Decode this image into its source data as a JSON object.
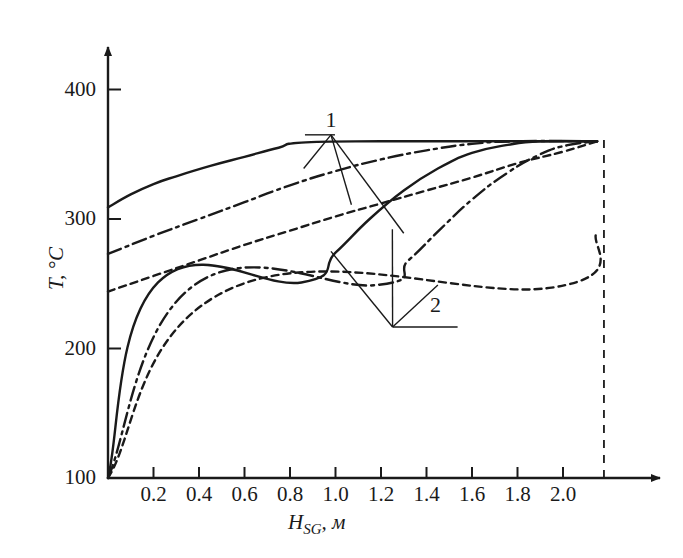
{
  "figure": {
    "background_color": "#ffffff",
    "ink_color": "#1a1a1a"
  },
  "axes": {
    "y": {
      "title": "T, °C",
      "ticks": [
        "100",
        "200",
        "300",
        "400"
      ],
      "tick_values": [
        100,
        200,
        300,
        400
      ],
      "range": [
        100,
        425
      ]
    },
    "x": {
      "title": "H_SG, м",
      "title_main": "H",
      "title_sub": "SG",
      "title_unit": ", м",
      "ticks": [
        "0.2",
        "0.4",
        "0.6",
        "0.8",
        "1.0",
        "1.2",
        "1.4",
        "1.6",
        "1.8",
        "2.0"
      ],
      "tick_values": [
        0.2,
        0.4,
        0.6,
        0.8,
        1.0,
        1.2,
        1.4,
        1.6,
        1.8,
        2.0
      ],
      "range": [
        0,
        2.27
      ]
    }
  },
  "annotations": [
    {
      "name": "group-label-1",
      "text": "1",
      "x": 0.98,
      "y": 365
    },
    {
      "name": "group-label-2",
      "text": "2",
      "x": 1.44,
      "y": 222
    }
  ],
  "chart_data": {
    "type": "line",
    "title": "",
    "xlabel": "H_SG, м",
    "ylabel": "T, °C",
    "xlim": [
      0,
      2.27
    ],
    "ylim": [
      100,
      425
    ],
    "grid": false,
    "legend": "none",
    "group_labels": [
      "1",
      "2"
    ],
    "series": [
      {
        "name": "group1-solid",
        "group": "1",
        "style": "solid",
        "points": [
          [
            0.0,
            309
          ],
          [
            0.1,
            319
          ],
          [
            0.2,
            327
          ],
          [
            0.3,
            333
          ],
          [
            0.45,
            341
          ],
          [
            0.6,
            348
          ],
          [
            0.75,
            355
          ],
          [
            0.85,
            359
          ],
          [
            1.2,
            360
          ],
          [
            1.6,
            360
          ],
          [
            2.15,
            360
          ]
        ]
      },
      {
        "name": "group1-dashdot",
        "group": "1",
        "style": "dashdot",
        "points": [
          [
            0.0,
            273
          ],
          [
            0.2,
            287
          ],
          [
            0.4,
            300
          ],
          [
            0.6,
            313
          ],
          [
            0.8,
            326
          ],
          [
            1.0,
            337
          ],
          [
            1.2,
            346
          ],
          [
            1.4,
            353
          ],
          [
            1.6,
            358
          ],
          [
            1.8,
            360
          ],
          [
            2.15,
            360
          ]
        ]
      },
      {
        "name": "group1-dashed",
        "group": "1",
        "style": "dashed",
        "points": [
          [
            0.0,
            244
          ],
          [
            0.2,
            256
          ],
          [
            0.4,
            268
          ],
          [
            0.6,
            280
          ],
          [
            0.8,
            291
          ],
          [
            1.0,
            302
          ],
          [
            1.2,
            312
          ],
          [
            1.4,
            322
          ],
          [
            1.6,
            332
          ],
          [
            1.8,
            343
          ],
          [
            2.0,
            352
          ],
          [
            2.15,
            360
          ]
        ]
      },
      {
        "name": "group2-solid",
        "group": "2",
        "style": "solid",
        "points": [
          [
            0.0,
            100
          ],
          [
            0.22,
            251
          ],
          [
            0.85,
            251
          ],
          [
            1.0,
            274
          ],
          [
            1.15,
            300
          ],
          [
            1.3,
            322
          ],
          [
            1.45,
            339
          ],
          [
            1.6,
            351
          ],
          [
            1.75,
            357
          ],
          [
            1.9,
            360
          ],
          [
            2.15,
            360
          ]
        ]
      },
      {
        "name": "group2-dashdot",
        "group": "2",
        "style": "dashdot",
        "points": [
          [
            0.0,
            100
          ],
          [
            0.38,
            249
          ],
          [
            1.18,
            249
          ],
          [
            1.32,
            268
          ],
          [
            1.46,
            292
          ],
          [
            1.6,
            315
          ],
          [
            1.75,
            335
          ],
          [
            1.9,
            350
          ],
          [
            2.02,
            357
          ],
          [
            2.15,
            360
          ]
        ]
      },
      {
        "name": "group2-dashed",
        "group": "2",
        "style": "dashed",
        "points": [
          [
            0.0,
            100
          ],
          [
            0.55,
            247
          ],
          [
            1.95,
            247
          ],
          [
            2.15,
            290
          ]
        ]
      }
    ],
    "reference_line": {
      "name": "right-boundary",
      "style": "dashed",
      "x": 2.18,
      "y_from": 100,
      "y_to": 362
    }
  }
}
